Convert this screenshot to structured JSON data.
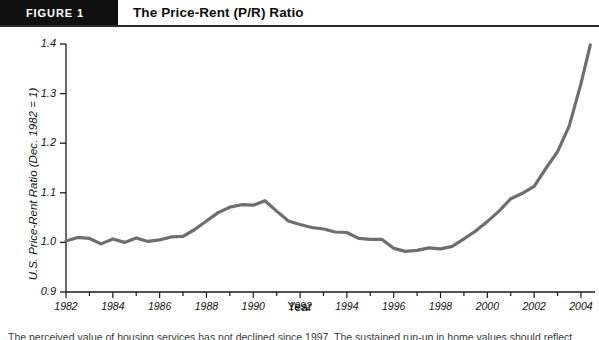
{
  "header": {
    "figure_tag": "FIGURE 1",
    "title": "The Price-Rent (P/R) Ratio"
  },
  "caption": {
    "text": "The perceived value of housing services has not declined since 1997. The sustained run-up in home values should reflect"
  },
  "chart_data": {
    "type": "line",
    "title": "The Price-Rent (P/R) Ratio",
    "xlabel": "Year",
    "ylabel": "U.S. Price-Rent Ratio (Dec. 1982 = 1)",
    "xlim": [
      1982,
      2004.6
    ],
    "ylim": [
      0.9,
      1.4
    ],
    "grid": false,
    "legend": "none",
    "line_color": "#6e6e6e",
    "line_width": 3.2,
    "y_ticks": [
      "0.9",
      "1.0",
      "1.1",
      "1.2",
      "1.3",
      "1.4"
    ],
    "y_tick_values": [
      0.9,
      1.0,
      1.1,
      1.2,
      1.3,
      1.4
    ],
    "x_ticks": [
      "1982",
      "1984",
      "1986",
      "1988",
      "1990",
      "1992",
      "1994",
      "1996",
      "1998",
      "2000",
      "2002",
      "2004"
    ],
    "x_tick_values": [
      1982,
      1984,
      1986,
      1988,
      1990,
      1992,
      1994,
      1996,
      1998,
      2000,
      2002,
      2004
    ],
    "x_minor_interval": 1,
    "x": [
      1982.0,
      1982.5,
      1983.0,
      1983.5,
      1984.0,
      1984.5,
      1985.0,
      1985.5,
      1986.0,
      1986.5,
      1987.0,
      1987.5,
      1988.0,
      1988.5,
      1989.0,
      1989.5,
      1990.0,
      1990.5,
      1991.0,
      1991.5,
      1992.0,
      1992.5,
      1993.0,
      1993.5,
      1994.0,
      1994.5,
      1995.0,
      1995.5,
      1996.0,
      1996.5,
      1997.0,
      1997.5,
      1998.0,
      1998.5,
      1999.0,
      1999.5,
      2000.0,
      2000.5,
      2001.0,
      2001.5,
      2002.0,
      2002.5,
      2003.0,
      2003.5,
      2004.0,
      2004.4
    ],
    "values": [
      1.003,
      1.01,
      1.008,
      0.997,
      1.007,
      1.0,
      1.009,
      1.002,
      1.005,
      1.011,
      1.012,
      1.026,
      1.043,
      1.06,
      1.071,
      1.076,
      1.075,
      1.084,
      1.063,
      1.043,
      1.036,
      1.03,
      1.027,
      1.021,
      1.02,
      1.008,
      1.006,
      1.006,
      0.988,
      0.982,
      0.984,
      0.989,
      0.987,
      0.992,
      1.007,
      1.023,
      1.042,
      1.063,
      1.088,
      1.099,
      1.113,
      1.149,
      1.183,
      1.235,
      1.32,
      1.398
    ],
    "annotations": []
  }
}
